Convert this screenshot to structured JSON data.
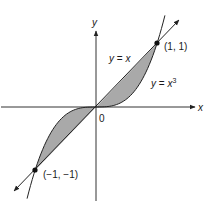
{
  "figure": {
    "axes": {
      "x_label": "x",
      "y_label": "y",
      "origin_label": "0"
    },
    "curves": [
      {
        "name": "line",
        "label_prefix": "y = ",
        "label_var": "x",
        "label_sup": ""
      },
      {
        "name": "cubic",
        "label_prefix": "y = ",
        "label_var": "x",
        "label_sup": "3"
      }
    ],
    "points": [
      {
        "label": "(1, 1)",
        "x": 1,
        "y": 1
      },
      {
        "label": "(−1, −1)",
        "x": -1,
        "y": -1
      }
    ],
    "shading_color": "#a9a9a9",
    "line_color": "#222222"
  }
}
